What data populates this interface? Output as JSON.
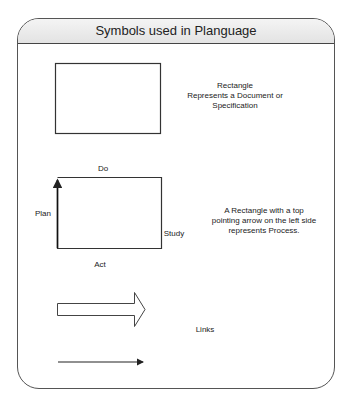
{
  "title": "Symbols used in Planguage",
  "symbols": [
    {
      "shape": "rectangle",
      "description": [
        "Rectangle",
        "Represents a Document or",
        "Specification"
      ]
    },
    {
      "shape": "process-rectangle",
      "side_labels": {
        "top": "Do",
        "left": "Plan",
        "right": "Study",
        "bottom": "Act"
      },
      "description": [
        "A Rectangle with a top",
        "pointing arrow on the left side",
        "represents Process."
      ]
    },
    {
      "shape": "arrows",
      "description": [
        "Links"
      ]
    }
  ]
}
